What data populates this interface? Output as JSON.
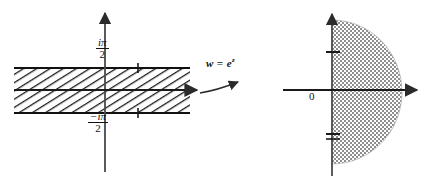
{
  "figure": {
    "colors": {
      "stroke": "#111111",
      "axis": "#3b3b3b",
      "hatch": "#1a1a1a",
      "stipple": "#8e8e8e",
      "background": "#ffffff"
    }
  },
  "left_panel": {
    "name": "z-plane",
    "region_description": "horizontal strip -pi/2 < Im z < pi/2, diagonally hatched",
    "labels": {
      "upper_boundary": {
        "numerator": "iπ",
        "denominator": "2"
      },
      "lower_boundary": {
        "numerator": "−iπ",
        "denominator": "2"
      }
    },
    "axes": {
      "real_axis": {
        "x_start": 14,
        "x_end": 196,
        "y": 90,
        "arrow": "right"
      },
      "imaginary_axis": {
        "x": 105,
        "y_start": 10,
        "y_end": 172,
        "arrow": "up"
      }
    },
    "strip": {
      "x_start": 14,
      "x_end": 190,
      "y_top": 68,
      "y_bottom": 113
    },
    "ticks": [
      {
        "axis": "real",
        "x": 138,
        "y": 68,
        "label": ""
      },
      {
        "axis": "real",
        "x": 138,
        "y": 113,
        "label": ""
      }
    ]
  },
  "map_arrow": {
    "label_w": "w",
    "label_eq": "=",
    "label_base": "e",
    "label_exponent": "z",
    "direction": "left-to-right"
  },
  "right_panel": {
    "name": "w-plane",
    "region_description": "stippled half-disk in the right half plane, Re w > 0",
    "labels": {
      "origin": "0"
    },
    "axes": {
      "real_axis": {
        "x_start": 283,
        "x_end": 416,
        "y": 90,
        "arrow": "right"
      },
      "imaginary_axis": {
        "x": 332,
        "y_start": 12,
        "y_end": 176,
        "arrow": "up"
      }
    },
    "half_disk": {
      "center_x": 332,
      "center_y": 92,
      "radius_x": 70,
      "radius_y": 72
    },
    "ticks": [
      {
        "axis": "imaginary",
        "x": 332,
        "y": 52,
        "label": ""
      },
      {
        "axis": "imaginary",
        "x": 332,
        "y": 134,
        "label": ""
      }
    ]
  }
}
